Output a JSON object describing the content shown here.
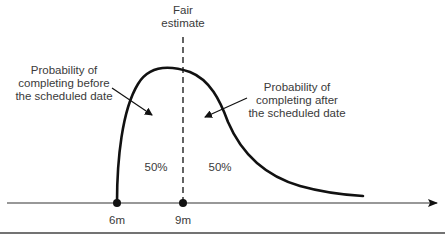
{
  "diagram": {
    "title_label": {
      "line1": "Fair",
      "line2": "estimate"
    },
    "left_annotation": {
      "line1": "Probability of",
      "line2": "completing before",
      "line3": "the scheduled date"
    },
    "right_annotation": {
      "line1": "Probability of",
      "line2": "completing after",
      "line3": "the scheduled date"
    },
    "left_area_percent": "50%",
    "right_area_percent": "50%",
    "axis_points": [
      {
        "label": "6m"
      },
      {
        "label": "9m"
      }
    ],
    "colors": {
      "line": "#111111",
      "text": "#3a3a3a",
      "axis": "#333333"
    }
  }
}
